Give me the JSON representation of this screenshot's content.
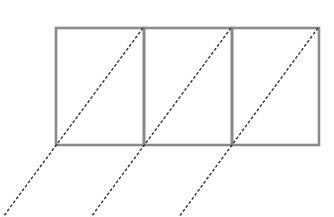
{
  "diagram": {
    "colors": {
      "background": "#ffffff",
      "box_stroke": "#8a8a8a",
      "dashed_stroke": "#333333"
    },
    "box_row": {
      "x": 56,
      "y": 28,
      "height": 117,
      "stroke_width": 2.6,
      "cells": [
        {
          "x": 56,
          "width": 88
        },
        {
          "x": 144,
          "width": 88
        },
        {
          "x": 232,
          "width": 87
        }
      ]
    },
    "dashed_lines": [
      {
        "x1": 143,
        "y1": 28,
        "x2": 3,
        "y2": 217
      },
      {
        "x1": 231,
        "y1": 28,
        "x2": 91,
        "y2": 217
      },
      {
        "x1": 318,
        "y1": 28,
        "x2": 179,
        "y2": 217
      }
    ],
    "dash_pattern": "3,2",
    "dash_width": 1.4
  }
}
